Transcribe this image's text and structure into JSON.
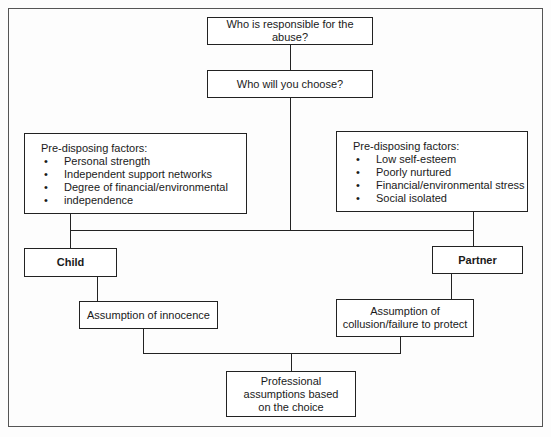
{
  "diagram": {
    "nodes": {
      "responsible": {
        "label": "Who is responsible for the abuse?"
      },
      "choose": {
        "label": "Who will you choose?"
      },
      "child_factors": {
        "title": "Pre-disposing factors:",
        "items": [
          "Personal strength",
          "Independent support networks",
          "Degree of financial/environmental",
          "independence"
        ]
      },
      "partner_factors": {
        "title": "Pre-disposing factors:",
        "items": [
          "Low self-esteem",
          "Poorly nurtured",
          "Financial/environmental stress",
          "Social isolated"
        ]
      },
      "child": {
        "label": "Child"
      },
      "partner": {
        "label": "Partner"
      },
      "innocence": {
        "label": "Assumption of innocence"
      },
      "collusion": {
        "line1": "Assumption of",
        "line2": "collusion/failure to protect"
      },
      "professional": {
        "line1": "Professional",
        "line2": "assumptions based",
        "line3": "on the choice"
      }
    },
    "edges": [
      [
        "responsible",
        "choose"
      ],
      [
        "choose",
        "child"
      ],
      [
        "choose",
        "partner"
      ],
      [
        "child_factors",
        "child"
      ],
      [
        "partner_factors",
        "partner"
      ],
      [
        "child",
        "innocence"
      ],
      [
        "partner",
        "collusion"
      ],
      [
        "innocence",
        "professional"
      ],
      [
        "collusion",
        "professional"
      ]
    ]
  }
}
